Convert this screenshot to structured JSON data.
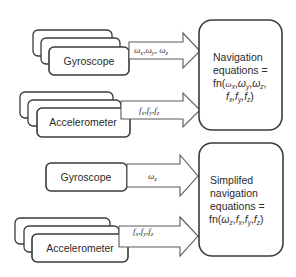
{
  "diagram": {
    "top": {
      "gyroscope": {
        "label": "Gyroscope",
        "stacked": true
      },
      "gyro_signal": "ωx,ωy, ωz",
      "accelerometer": {
        "label": "Accelerometer",
        "stacked": true
      },
      "accel_signal": "fx,fy,fz",
      "equations": {
        "lines": [
          "Navigation",
          "equations =",
          "fn(ωx,ωy,ωz,",
          "fx,fy,fz)"
        ]
      }
    },
    "bottom": {
      "gyroscope": {
        "label": "Gyroscope",
        "stacked": false
      },
      "gyro_signal": "ωz",
      "accelerometer": {
        "label": "Accelerometer",
        "stacked": true
      },
      "accel_signal": "fx,fy,fz",
      "equations": {
        "lines": [
          "Simplifed",
          "navigation",
          "equations =",
          "fn(ωz,fx,fy,fz)"
        ]
      }
    }
  }
}
